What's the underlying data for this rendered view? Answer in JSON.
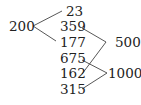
{
  "diagram": {
    "left_node": "200",
    "middle_nodes": [
      "23",
      "359",
      "177",
      "675",
      "162",
      "315"
    ],
    "right_nodes": [
      "500",
      "1000"
    ],
    "connections": [
      {
        "from": "200",
        "to": "23"
      },
      {
        "from": "200",
        "to": "177"
      },
      {
        "from": "359",
        "to": "500"
      },
      {
        "from": "162",
        "to": "500"
      },
      {
        "from": "675",
        "to": "1000"
      },
      {
        "from": "315",
        "to": "1000"
      }
    ],
    "line_color": "#444444"
  }
}
